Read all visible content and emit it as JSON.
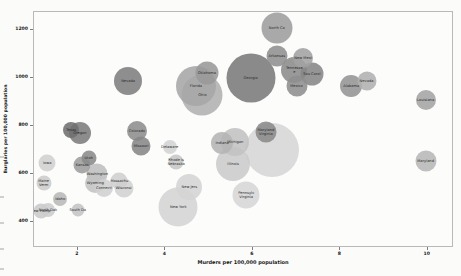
{
  "chart_data": {
    "type": "scatter",
    "subtype": "bubble",
    "title": "",
    "xlabel": "Murders per 100,000 population",
    "ylabel": "Burglaries per 100,000 population",
    "xlim": [
      1.0,
      10.6
    ],
    "ylim": [
      290,
      1275
    ],
    "xticks": [
      2,
      4,
      6,
      8,
      10
    ],
    "xticklabels": [
      "2",
      "4",
      "6",
      "8",
      "10"
    ],
    "yticks": [
      400,
      600,
      800,
      1000,
      1200
    ],
    "yticklabels": [
      "400",
      "600",
      "800",
      "1000",
      "1200"
    ],
    "grid": false,
    "legend": false,
    "size_encodes": "population",
    "color_encodes": "value",
    "points": [
      {
        "label": "North Ca",
        "x": 6.55,
        "y": 1208,
        "r": 15.5,
        "color": "#9d9d9d"
      },
      {
        "label": "Arkansas",
        "x": 6.55,
        "y": 1090,
        "r": 10.5,
        "color": "#8f8f8f"
      },
      {
        "label": "New Mexi",
        "x": 7.15,
        "y": 1085,
        "r": 10.0,
        "color": "#a2a2a2"
      },
      {
        "label": "Tennesse\ne",
        "x": 6.95,
        "y": 1035,
        "r": 13.0,
        "color": "#8b8b8b"
      },
      {
        "label": "Sou Carol",
        "x": 7.35,
        "y": 1018,
        "r": 11.5,
        "color": "#868686"
      },
      {
        "label": "Georgia",
        "x": 5.95,
        "y": 1000,
        "r": 24.5,
        "color": "#7a7a7a"
      },
      {
        "label": "Oklahoma",
        "x": 4.95,
        "y": 1022,
        "r": 11.5,
        "color": "#999999"
      },
      {
        "label": "Florida",
        "x": 4.7,
        "y": 965,
        "r": 20.0,
        "color": "#a6a6a6"
      },
      {
        "label": "Ohio",
        "x": 4.85,
        "y": 930,
        "r": 20.5,
        "color": "#b1b1b1"
      },
      {
        "label": "Mexico",
        "x": 7.0,
        "y": 965,
        "r": 10.5,
        "color": "#8e8e8e"
      },
      {
        "label": "Alabama",
        "x": 8.25,
        "y": 968,
        "r": 11.0,
        "color": "#949494"
      },
      {
        "label": "Nevada",
        "x": 8.6,
        "y": 985,
        "r": 9.5,
        "color": "#b0b0b0"
      },
      {
        "label": "Louisiana",
        "x": 9.95,
        "y": 908,
        "r": 10.0,
        "color": "#a4a4a4"
      },
      {
        "label": "Maryland",
        "x": 9.95,
        "y": 655,
        "r": 10.5,
        "color": "#b7b7b7"
      },
      {
        "label": "Nevada",
        "x": 3.15,
        "y": 985,
        "r": 14.0,
        "color": "#7e7e7e"
      },
      {
        "label": "Texas",
        "x": 1.85,
        "y": 783,
        "r": 8.0,
        "color": "#6f6f6f"
      },
      {
        "label": "Oregon",
        "x": 2.05,
        "y": 772,
        "r": 11.0,
        "color": "#7c7c7c"
      },
      {
        "label": "Colorado",
        "x": 3.35,
        "y": 778,
        "r": 10.0,
        "color": "#8d8d8d"
      },
      {
        "label": "Missouri",
        "x": 3.45,
        "y": 715,
        "r": 9.5,
        "color": "#868686"
      },
      {
        "label": "Delaware",
        "x": 4.1,
        "y": 712,
        "r": 7.0,
        "color": "#d3d3d3"
      },
      {
        "label": "Rhode Is\nNebraska",
        "x": 4.25,
        "y": 648,
        "r": 7.5,
        "color": "#c6c6c6"
      },
      {
        "label": "Indiana",
        "x": 5.3,
        "y": 730,
        "r": 11.0,
        "color": "#b4b4b4"
      },
      {
        "label": "Michigan",
        "x": 5.6,
        "y": 732,
        "r": 14.0,
        "color": "#c2c2c2"
      },
      {
        "label": "Illinois",
        "x": 5.55,
        "y": 640,
        "r": 17.0,
        "color": "#cbcbcb"
      },
      {
        "label": "Maryland\nVirginia",
        "x": 6.3,
        "y": 775,
        "r": 10.5,
        "color": "#8a8a8a"
      },
      {
        "label": "",
        "x": 6.45,
        "y": 700,
        "r": 27.0,
        "color": "#d6d6d6"
      },
      {
        "label": "Iowa",
        "x": 1.3,
        "y": 645,
        "r": 8.5,
        "color": "#d0d0d0"
      },
      {
        "label": "Utah",
        "x": 2.25,
        "y": 665,
        "r": 7.5,
        "color": "#8a8a8a"
      },
      {
        "label": "Kansas",
        "x": 2.1,
        "y": 635,
        "r": 8.5,
        "color": "#9d9d9d"
      },
      {
        "label": "Washington",
        "x": 2.45,
        "y": 597,
        "r": 10.5,
        "color": "#bebebe"
      },
      {
        "label": "Wyoming",
        "x": 2.4,
        "y": 562,
        "r": 10.0,
        "color": "#c3c3c3"
      },
      {
        "label": "Maine\nVerm",
        "x": 1.22,
        "y": 562,
        "r": 7.5,
        "color": "#cccccc"
      },
      {
        "label": "Connecti",
        "x": 2.6,
        "y": 540,
        "r": 9.0,
        "color": "#d0d0d0"
      },
      {
        "label": "Massachu",
        "x": 2.95,
        "y": 568,
        "r": 8.5,
        "color": "#cfcfcf"
      },
      {
        "label": "Wisconsi",
        "x": 3.05,
        "y": 540,
        "r": 9.5,
        "color": "#d2d2d2"
      },
      {
        "label": "Idaho",
        "x": 1.6,
        "y": 495,
        "r": 7.0,
        "color": "#b8b8b8"
      },
      {
        "label": "South Da",
        "x": 2.0,
        "y": 450,
        "r": 6.5,
        "color": "#c4c4c4"
      },
      {
        "label": "New Hamp",
        "x": 1.15,
        "y": 445,
        "r": 7.5,
        "color": "#c9c9c9"
      },
      {
        "label": "North Dak",
        "x": 1.32,
        "y": 448,
        "r": 7.0,
        "color": "#cccccc"
      },
      {
        "label": "New Jers",
        "x": 4.55,
        "y": 545,
        "r": 13.0,
        "color": "#d4d4d4"
      },
      {
        "label": "New York",
        "x": 4.3,
        "y": 462,
        "r": 19.5,
        "color": "#d4d4d4"
      },
      {
        "label": "Pennsylv\nVirginia",
        "x": 5.85,
        "y": 512,
        "r": 13.5,
        "color": "#d6d6d6"
      }
    ]
  },
  "axes": {
    "xlabel": "Murders per 100,000 population",
    "ylabel": "Burglaries per 100,000 population",
    "x_tick_labels": [
      "2",
      "4",
      "6",
      "8",
      "10"
    ],
    "y_tick_labels": [
      "1200",
      "1000",
      "800",
      "600",
      "400"
    ]
  }
}
